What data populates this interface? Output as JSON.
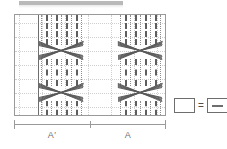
{
  "header": {
    "redacted_bar": ""
  },
  "axis": {
    "segments": [
      {
        "label": "A′"
      },
      {
        "label": "A"
      }
    ]
  },
  "legend": {
    "equals": "=",
    "left_box_label": "",
    "right_box_label": "",
    "left_icon": "empty-box-icon",
    "right_icon": "box-with-dash-icon"
  },
  "chart_data": {
    "type": "diagram",
    "title": "",
    "xlabel": "",
    "ylabel": "",
    "grid": true,
    "xlim": [
      0,
      152
    ],
    "ylim": [
      0,
      102
    ],
    "axis_segments": [
      {
        "label": "A′",
        "start": 0,
        "end": 76
      },
      {
        "label": "A",
        "start": 76,
        "end": 152
      }
    ],
    "horizontal_gridlines": [
      8,
      22,
      36,
      50,
      64,
      78,
      92
    ],
    "vertical_gridlines": [
      4,
      27,
      50,
      73,
      96,
      119,
      142
    ],
    "solid_vertical_reference": [
      23
    ],
    "strand_columns_bold": [
      31,
      41,
      51,
      61,
      110,
      120,
      130,
      140
    ],
    "strand_columns_light": [
      26,
      36,
      46,
      56,
      66,
      105,
      115,
      125,
      135,
      145
    ],
    "crossing_groups": [
      {
        "name": "upper-left-crossing",
        "cx": 46,
        "cy": 35,
        "width": 44,
        "height": 14
      },
      {
        "name": "upper-right-crossing",
        "cx": 125,
        "cy": 35,
        "width": 44,
        "height": 14
      },
      {
        "name": "lower-left-crossing",
        "cx": 46,
        "cy": 77,
        "width": 44,
        "height": 14
      },
      {
        "name": "lower-right-crossing",
        "cx": 125,
        "cy": 77,
        "width": 44,
        "height": 14
      }
    ],
    "legend_note": "box = box-with-dash"
  }
}
